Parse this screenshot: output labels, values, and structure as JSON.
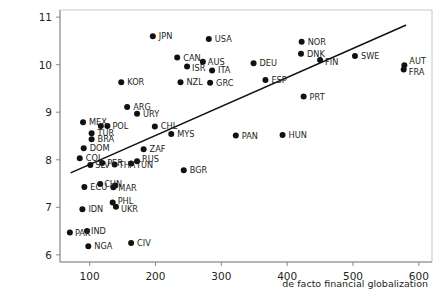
{
  "chart_data": {
    "type": "scatter",
    "title": "",
    "subtitle": "",
    "xlabel": "de facto financial globalization",
    "ylabel": "",
    "xlim": [
      55,
      620
    ],
    "ylim": [
      5.85,
      11.15
    ],
    "xticks": [
      100,
      200,
      300,
      400,
      500,
      600
    ],
    "yticks": [
      6,
      7,
      8,
      9,
      10,
      11
    ],
    "grid": false,
    "legend": null,
    "point_label_field": "country",
    "trendline": {
      "name": "linear fit",
      "x": [
        72,
        580
      ],
      "y": [
        7.73,
        10.83
      ]
    },
    "points": [
      {
        "country": "JPN",
        "x": 196,
        "y": 10.6
      },
      {
        "country": "USA",
        "x": 281,
        "y": 10.54
      },
      {
        "country": "NOR",
        "x": 422,
        "y": 10.48
      },
      {
        "country": "CAN",
        "x": 233,
        "y": 10.15
      },
      {
        "country": "DNK",
        "x": 421,
        "y": 10.23
      },
      {
        "country": "SWE",
        "x": 503,
        "y": 10.18
      },
      {
        "country": "AUS",
        "x": 272,
        "y": 10.06
      },
      {
        "country": "ISR",
        "x": 248,
        "y": 9.96
      },
      {
        "country": "FIN",
        "x": 450,
        "y": 10.1
      },
      {
        "country": "ITA",
        "x": 286,
        "y": 9.88
      },
      {
        "country": "DEU",
        "x": 349,
        "y": 10.03
      },
      {
        "country": "AUT",
        "x": 578,
        "y": 9.99
      },
      {
        "country": "FRA",
        "x": 577,
        "y": 9.9
      },
      {
        "country": "KOR",
        "x": 148,
        "y": 9.63
      },
      {
        "country": "NZL",
        "x": 238,
        "y": 9.63
      },
      {
        "country": "GRC",
        "x": 283,
        "y": 9.62
      },
      {
        "country": "ESP",
        "x": 367,
        "y": 9.68
      },
      {
        "country": "PRT",
        "x": 425,
        "y": 9.33
      },
      {
        "country": "ARG",
        "x": 157,
        "y": 9.11
      },
      {
        "country": "URY",
        "x": 172,
        "y": 8.97
      },
      {
        "country": "MEX",
        "x": 90,
        "y": 8.79
      },
      {
        "country": "POL",
        "x": 127,
        "y": 8.71
      },
      {
        "country": "ROU",
        "x": 117,
        "y": 8.71
      },
      {
        "country": "CHL",
        "x": 199,
        "y": 8.7
      },
      {
        "country": "TUR",
        "x": 103,
        "y": 8.56
      },
      {
        "country": "MYS",
        "x": 224,
        "y": 8.54
      },
      {
        "country": "PAN",
        "x": 322,
        "y": 8.51
      },
      {
        "country": "HUN",
        "x": 393,
        "y": 8.52
      },
      {
        "country": "BRA",
        "x": 103,
        "y": 8.43
      },
      {
        "country": "DOM",
        "x": 91,
        "y": 8.24
      },
      {
        "country": "ZAF",
        "x": 182,
        "y": 8.22
      },
      {
        "country": "COL",
        "x": 85,
        "y": 8.03
      },
      {
        "country": "RUS",
        "x": 172,
        "y": 7.97
      },
      {
        "country": "PER",
        "x": 119,
        "y": 7.93
      },
      {
        "country": "SLV",
        "x": 101,
        "y": 7.89
      },
      {
        "country": "THA",
        "x": 138,
        "y": 7.9
      },
      {
        "country": "TUN",
        "x": 163,
        "y": 7.92
      },
      {
        "country": "BGR",
        "x": 243,
        "y": 7.78
      },
      {
        "country": "CHN",
        "x": 116,
        "y": 7.49
      },
      {
        "country": "IDN",
        "x": 139,
        "y": 7.46
      },
      {
        "country": "MAR",
        "x": 136,
        "y": 7.42
      },
      {
        "country": "ECU",
        "x": 92,
        "y": 7.43
      },
      {
        "country": "PHL",
        "x": 135,
        "y": 7.1
      },
      {
        "country": "UKR",
        "x": 140,
        "y": 7.01
      },
      {
        "country": "IDN2",
        "x": 89,
        "y": 6.96
      },
      {
        "country": "IND",
        "x": 96,
        "y": 6.5
      },
      {
        "country": "PAK",
        "x": 70,
        "y": 6.47
      },
      {
        "country": "CIV",
        "x": 163,
        "y": 6.25
      },
      {
        "country": "NGA",
        "x": 98,
        "y": 6.18
      }
    ],
    "point_labels": [
      {
        "country": "JPN",
        "text": "JPN",
        "dx": 6,
        "dy": 3
      },
      {
        "country": "USA",
        "text": "USA",
        "dx": 6,
        "dy": 3
      },
      {
        "country": "NOR",
        "text": "NOR",
        "dx": 6,
        "dy": 3
      },
      {
        "country": "CAN",
        "text": "CAN",
        "dx": 6,
        "dy": 3
      },
      {
        "country": "DNK",
        "text": "DNK",
        "dx": 6,
        "dy": 3
      },
      {
        "country": "SWE",
        "text": "SWE",
        "dx": 6,
        "dy": 3
      },
      {
        "country": "AUS",
        "text": "AUS",
        "dx": 5,
        "dy": 0
      },
      {
        "country": "ISR",
        "text": "ISR",
        "dx": 5,
        "dy": 4
      },
      {
        "country": "FIN",
        "text": "FIN",
        "dx": 5,
        "dy": 5
      },
      {
        "country": "ITA",
        "text": "ITA",
        "dx": 6,
        "dy": 3
      },
      {
        "country": "DEU",
        "text": "DEU",
        "dx": 6,
        "dy": 3
      },
      {
        "country": "AUT",
        "text": "AUT",
        "dx": 5,
        "dy": -1
      },
      {
        "country": "FRA",
        "text": "FRA",
        "dx": 5,
        "dy": 6
      },
      {
        "country": "KOR",
        "text": "KOR",
        "dx": 6,
        "dy": 3
      },
      {
        "country": "NZL",
        "text": "NZL",
        "dx": 6,
        "dy": 3
      },
      {
        "country": "GRC",
        "text": "GRC",
        "dx": 6,
        "dy": 3
      },
      {
        "country": "ESP",
        "text": "ESP",
        "dx": 6,
        "dy": 3
      },
      {
        "country": "PRT",
        "text": "PRT",
        "dx": 6,
        "dy": 3
      },
      {
        "country": "ARG",
        "text": "ARG",
        "dx": 6,
        "dy": 3
      },
      {
        "country": "URY",
        "text": "URY",
        "dx": 6,
        "dy": 3
      },
      {
        "country": "MEX",
        "text": "MEX",
        "dx": 6,
        "dy": 3
      },
      {
        "country": "POL",
        "text": "POL",
        "dx": 5,
        "dy": 3
      },
      {
        "country": "ROU",
        "text": "",
        "dx": 5,
        "dy": 3
      },
      {
        "country": "CHL",
        "text": "CHL",
        "dx": 6,
        "dy": 3
      },
      {
        "country": "TUR",
        "text": "TUR",
        "dx": 6,
        "dy": 3
      },
      {
        "country": "MYS",
        "text": "MYS",
        "dx": 6,
        "dy": 3
      },
      {
        "country": "PAN",
        "text": "PAN",
        "dx": 6,
        "dy": 3
      },
      {
        "country": "HUN",
        "text": "HUN",
        "dx": 6,
        "dy": 3
      },
      {
        "country": "BRA",
        "text": "BRA",
        "dx": 6,
        "dy": 3
      },
      {
        "country": "DOM",
        "text": "DOM",
        "dx": 6,
        "dy": 3
      },
      {
        "country": "ZAF",
        "text": "ZAF",
        "dx": 6,
        "dy": 3
      },
      {
        "country": "COL",
        "text": "COL",
        "dx": 6,
        "dy": 3
      },
      {
        "country": "RUS",
        "text": "RUS",
        "dx": 5,
        "dy": 1
      },
      {
        "country": "PER",
        "text": "PER",
        "dx": 5,
        "dy": 3
      },
      {
        "country": "SLV",
        "text": "SLV",
        "dx": 5,
        "dy": 3
      },
      {
        "country": "THA",
        "text": "THA",
        "dx": 4,
        "dy": 3
      },
      {
        "country": "TUN",
        "text": "TUN",
        "dx": 5,
        "dy": 4
      },
      {
        "country": "BGR",
        "text": "BGR",
        "dx": 6,
        "dy": 3
      },
      {
        "country": "CHN",
        "text": "CHN",
        "dx": 4,
        "dy": 0
      },
      {
        "country": "IDN",
        "text": "",
        "dx": 5,
        "dy": 3
      },
      {
        "country": "MAR",
        "text": "MAR",
        "dx": 5,
        "dy": 4
      },
      {
        "country": "ECU",
        "text": "ECU",
        "dx": 6,
        "dy": 3
      },
      {
        "country": "PHL",
        "text": "PHL",
        "dx": 5,
        "dy": 1
      },
      {
        "country": "UKR",
        "text": "UKR",
        "dx": 5,
        "dy": 5
      },
      {
        "country": "IDN2",
        "text": "IDN",
        "dx": 6,
        "dy": 3
      },
      {
        "country": "IND",
        "text": "IND",
        "dx": 4,
        "dy": 3
      },
      {
        "country": "PAK",
        "text": "PAK",
        "dx": 5,
        "dy": 3
      },
      {
        "country": "CIV",
        "text": "CIV",
        "dx": 6,
        "dy": 3
      },
      {
        "country": "NGA",
        "text": "NGA",
        "dx": 6,
        "dy": 3
      }
    ]
  },
  "axes": {
    "x_tick_labels": [
      "100",
      "200",
      "300",
      "400",
      "500",
      "600"
    ],
    "y_tick_labels": [
      "6",
      "7",
      "8",
      "9",
      "10",
      "11"
    ],
    "x_axis_title": "de facto financial globalization"
  },
  "colors": {
    "marker": "#111111",
    "trendline": "#111111",
    "axis": "#7d7d7d",
    "text": "#231f20",
    "background": "#ffffff"
  }
}
